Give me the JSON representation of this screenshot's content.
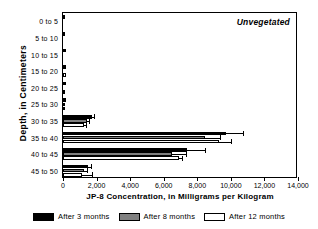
{
  "chart_data": {
    "type": "bar",
    "orientation": "horizontal",
    "title": "",
    "panel_label": "Unvegetated",
    "xlabel": "JP-8 Concentration, in Milligrams per Kilogram",
    "ylabel": "Depth, in Centimeters",
    "xlim": [
      0,
      14000
    ],
    "ylim_categories": 10,
    "grid": false,
    "legend_position": "bottom",
    "xticks": [
      0,
      2000,
      4000,
      6000,
      8000,
      10000,
      12000,
      14000
    ],
    "xticklabels": [
      "0",
      "2,000",
      "4,000",
      "6,000",
      "8,000",
      "10,000",
      "12,000",
      "14,000"
    ],
    "categories": [
      "0 to 5",
      "5 to 10",
      "10 to 15",
      "15 to 20",
      "20 to 25",
      "25 to 30",
      "30 to 35",
      "35 to 40",
      "40 to 45",
      "45 to 50"
    ],
    "series": [
      {
        "name": "After 3 months",
        "color": "#000000",
        "values": [
          130,
          20,
          175,
          200,
          160,
          185,
          1700,
          9700,
          7400,
          1500
        ],
        "errors": [
          0,
          0,
          0,
          0,
          0,
          0,
          170,
          1000,
          1050,
          160
        ]
      },
      {
        "name": "After 8 months",
        "color": "#808080",
        "values": [
          0,
          0,
          0,
          0,
          0,
          90,
          1420,
          8450,
          6500,
          1280
        ],
        "errors": [
          0,
          0,
          0,
          0,
          0,
          0,
          140,
          900,
          830,
          130
        ]
      },
      {
        "name": "After 12 months",
        "color": "#ffffff",
        "values": [
          0,
          0,
          0,
          150,
          110,
          120,
          1250,
          9300,
          6900,
          1150
        ],
        "errors": [
          0,
          0,
          0,
          0,
          0,
          0,
          130,
          700,
          190,
          560
        ]
      }
    ]
  },
  "legend": {
    "items": [
      {
        "label": "After 3 months",
        "swatch": "s0"
      },
      {
        "label": "After 8 months",
        "swatch": "s1"
      },
      {
        "label": "After 12 months",
        "swatch": "s2"
      }
    ]
  }
}
